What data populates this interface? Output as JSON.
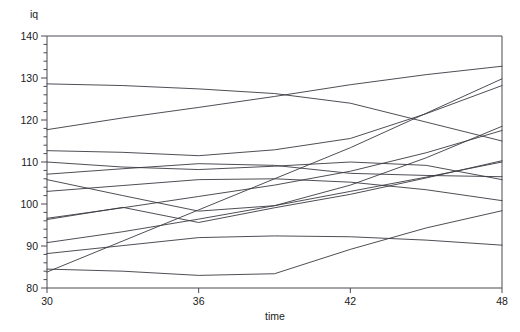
{
  "chart_data": {
    "type": "line",
    "title": "",
    "subtitle": "",
    "xlabel": "time",
    "ylabel": "iq",
    "xlim": [
      30,
      48
    ],
    "ylim": [
      80,
      140
    ],
    "xticks": [
      30,
      36,
      42,
      48
    ],
    "xtick_labels": [
      "30",
      "36",
      "42",
      "48"
    ],
    "yticks": [
      80,
      90,
      100,
      110,
      120,
      130,
      140
    ],
    "ytick_labels": [
      "80",
      "90",
      "100",
      "110",
      "120",
      "130",
      "140"
    ],
    "y_minor_tick_step": 2,
    "grid": false,
    "legend": null,
    "legend_position": "none",
    "line_color": "#3a3a42",
    "frame_color": "#4a4a52",
    "background_color": "#ffffff",
    "x": [
      30,
      33,
      36,
      39,
      42,
      45,
      48
    ],
    "series": [
      {
        "name": "subject-1",
        "values": [
          128.6,
          128.2,
          127.4,
          126.3,
          124.0,
          119.5,
          115.0
        ]
      },
      {
        "name": "subject-2",
        "values": [
          117.7,
          120.5,
          123.0,
          125.6,
          128.4,
          130.8,
          132.8
        ]
      },
      {
        "name": "subject-3",
        "values": [
          112.7,
          112.3,
          111.5,
          112.9,
          115.6,
          121.5,
          128.2
        ]
      },
      {
        "name": "subject-4",
        "values": [
          110.0,
          108.8,
          108.2,
          109.0,
          110.0,
          109.2,
          105.8
        ]
      },
      {
        "name": "subject-5",
        "values": [
          107.1,
          108.4,
          109.6,
          109.2,
          107.3,
          106.8,
          106.5
        ]
      },
      {
        "name": "subject-6",
        "values": [
          105.8,
          102.0,
          98.3,
          99.6,
          104.5,
          111.0,
          118.5
        ]
      },
      {
        "name": "subject-7",
        "values": [
          103.0,
          104.4,
          105.8,
          106.0,
          105.2,
          103.4,
          100.8
        ]
      },
      {
        "name": "subject-8",
        "values": [
          96.6,
          99.1,
          101.8,
          104.5,
          107.8,
          112.2,
          117.5
        ]
      },
      {
        "name": "subject-9",
        "values": [
          96.3,
          99.2,
          95.6,
          99.1,
          102.3,
          106.2,
          110.3
        ]
      },
      {
        "name": "subject-10",
        "values": [
          90.8,
          93.4,
          96.4,
          99.6,
          103.0,
          106.4,
          110.0
        ]
      },
      {
        "name": "subject-11",
        "values": [
          88.2,
          90.1,
          92.0,
          92.4,
          92.2,
          91.4,
          90.2
        ]
      },
      {
        "name": "subject-12",
        "values": [
          84.5,
          84.0,
          83.0,
          83.4,
          89.2,
          94.3,
          98.4
        ]
      },
      {
        "name": "subject-13",
        "values": [
          83.8,
          91.2,
          98.6,
          106.0,
          113.4,
          121.6,
          129.8
        ]
      }
    ]
  },
  "axes": {
    "y_axis_title": "iq",
    "x_axis_title": "time"
  }
}
